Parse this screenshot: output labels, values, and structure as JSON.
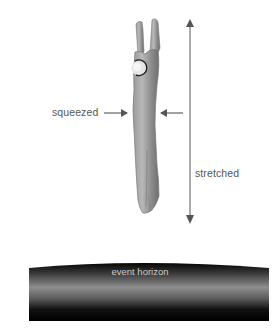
{
  "diagram": {
    "labels": {
      "squeezed": "squeezed",
      "stretched": "stretched",
      "event_horizon": "event horizon"
    },
    "colors": {
      "background": "#ffffff",
      "body_fill": "#8a8a8a",
      "body_highlight": "#b5b5b5",
      "arrow": "#555555",
      "label_text": "#555555",
      "horizon_dark": "#000000",
      "horizon_light": "#8c8c8c",
      "horizon_text": "#cfcfcf"
    },
    "icons": {
      "squeeze_arrows": "arrow-right / arrow-left",
      "stretch_arrow": "double-headed vertical arrow"
    }
  }
}
